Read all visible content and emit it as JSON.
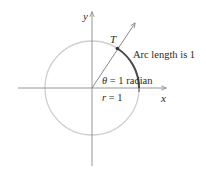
{
  "diagram": {
    "axes": {
      "x_label": "x",
      "y_label": "y"
    },
    "point_label": "T",
    "arc_label": "Arc length is 1",
    "angle_label": {
      "symbol": "θ",
      "equals": " = 1 ",
      "unit": "radian"
    },
    "radius_label": {
      "symbol": "r",
      "equals": " = 1"
    },
    "colors": {
      "circle": "#c8c8c8",
      "arc": "#4a4a4a",
      "axes": "#8a8a8a",
      "ray": "#6a6a6a",
      "text": "#2a2a2a"
    }
  }
}
